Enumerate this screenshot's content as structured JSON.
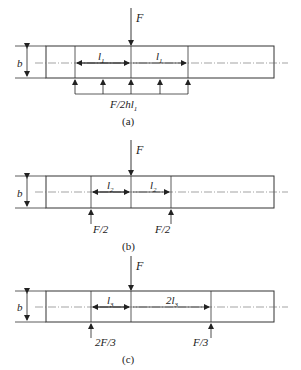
{
  "figure": {
    "panels": [
      {
        "id": "a",
        "caption": "(a)",
        "force_label": "F",
        "width_label": "b",
        "span_labels": [
          "l",
          "l"
        ],
        "span_subscript": "1",
        "load_label": "F/2hl",
        "load_subscript": "1",
        "support_type": "distributed"
      },
      {
        "id": "b",
        "caption": "(b)",
        "force_label": "F",
        "width_label": "b",
        "span_labels": [
          "l",
          "l"
        ],
        "span_subscript": "2",
        "reactions": [
          "F/2",
          "F/2"
        ],
        "support_type": "two-point-symmetric"
      },
      {
        "id": "c",
        "caption": "(c)",
        "force_label": "F",
        "width_label": "b",
        "span_labels": [
          "l",
          "2l"
        ],
        "span_subscript": "3",
        "reactions": [
          "2F/3",
          "F/3"
        ],
        "support_type": "two-point-asymmetric"
      }
    ],
    "colors": {
      "line": "#333333",
      "centerline": "#666666",
      "background": "#ffffff"
    }
  }
}
